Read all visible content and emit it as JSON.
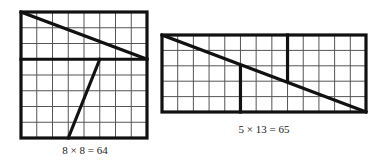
{
  "colors": {
    "grid_line": "#555555",
    "thick_line": "#111111",
    "background": "#ffffff"
  },
  "figures": [
    {
      "id": "square",
      "cols": 8,
      "rows": 8,
      "caption": "8 × 8 = 64",
      "box": {
        "x": 21,
        "y": 12,
        "w": 126,
        "h": 126
      },
      "cuts": [
        {
          "from": [
            0,
            0
          ],
          "to": [
            8,
            3
          ],
          "desc": "diagonal across top 3 rows"
        },
        {
          "from": [
            0,
            3
          ],
          "to": [
            8,
            3
          ],
          "desc": "horizontal divider at row 3"
        },
        {
          "from": [
            5,
            3
          ],
          "to": [
            3,
            8
          ],
          "desc": "slanted cut in lower 5 rows"
        }
      ],
      "caption_pos": {
        "x": 85,
        "y": 144
      }
    },
    {
      "id": "rectangle",
      "cols": 13,
      "rows": 5,
      "caption": "5 × 13 = 65",
      "box": {
        "x": 162,
        "y": 35,
        "w": 204,
        "h": 77
      },
      "cuts": [
        {
          "from": [
            0,
            0
          ],
          "to": [
            13,
            5
          ],
          "desc": "main diagonal"
        },
        {
          "from": [
            5,
            2
          ],
          "to": [
            5,
            5
          ],
          "desc": "vertical cut lower left"
        },
        {
          "from": [
            8,
            0
          ],
          "to": [
            8,
            3
          ],
          "desc": "vertical cut upper right"
        }
      ],
      "caption_pos": {
        "x": 264,
        "y": 123
      }
    }
  ]
}
